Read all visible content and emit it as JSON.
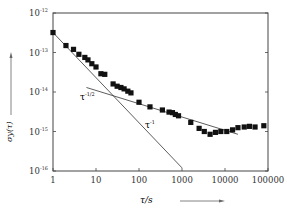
{
  "chart_data": {
    "type": "scatter",
    "title": "",
    "xlabel": "τ/s",
    "ylabel": "σy(τ)",
    "xscale": "log",
    "yscale": "log",
    "xlim": [
      1,
      100000
    ],
    "ylim": [
      1e-16,
      1e-12
    ],
    "grid": false,
    "x_ticks": [
      "1",
      "10",
      "100",
      "1000",
      "10000",
      "100000"
    ],
    "y_ticks": [
      {
        "base": "10",
        "exp": "-12"
      },
      {
        "base": "10",
        "exp": "-13"
      },
      {
        "base": "10",
        "exp": "-14"
      },
      {
        "base": "10",
        "exp": "-15"
      },
      {
        "base": "10",
        "exp": "-16"
      }
    ],
    "series": [
      {
        "name": "measured",
        "marker": "square",
        "x": [
          1,
          2,
          3,
          4,
          5.5,
          6.5,
          8,
          10,
          13,
          16,
          25,
          31,
          38,
          45,
          55,
          65,
          100,
          180,
          350,
          500,
          600,
          700,
          830,
          1600,
          2500,
          3300,
          4500,
          6000,
          8000,
          11000,
          15000,
          20000,
          28000,
          37000,
          50000,
          80000
        ],
        "y": [
          3.2e-13,
          1.5e-13,
          1.2e-13,
          9e-14,
          7.5e-14,
          6.5e-14,
          5.2e-14,
          4.3e-14,
          2.9e-14,
          2.8e-14,
          1.6e-14,
          1.4e-14,
          1.3e-14,
          1.2e-14,
          1.05e-14,
          9.5e-15,
          5.5e-15,
          4.2e-15,
          3.5e-15,
          3.1e-15,
          3e-15,
          2.7e-15,
          2.5e-15,
          1.7e-15,
          1.2e-15,
          1e-15,
          8.5e-16,
          9.5e-16,
          1e-15,
          1e-15,
          1.1e-15,
          1.25e-15,
          1.3e-15,
          1.35e-15,
          1.3e-15,
          1.4e-15
        ]
      }
    ],
    "reference_lines": [
      {
        "name": "τ^-1",
        "x": [
          1,
          1000
        ],
        "y": [
          3.2e-13,
          1.2e-16
        ]
      },
      {
        "name": "τ^-1/2",
        "x": [
          6,
          20000
        ],
        "y": [
          1.3e-14,
          8.5e-16
        ]
      }
    ],
    "annotations": [
      {
        "text": "τ",
        "sup": "-1/2",
        "near": [
          8,
          4e-15
        ]
      },
      {
        "text": "τ",
        "sup": "-1",
        "near": [
          250,
          1.7e-15
        ]
      }
    ],
    "legend": null
  },
  "labels": {
    "y_axis": "σy(τ)",
    "x_axis": "τ/s",
    "ann_half": "τ",
    "ann_half_sup": "-1/2",
    "ann_one": "τ",
    "ann_one_sup": "-1"
  }
}
